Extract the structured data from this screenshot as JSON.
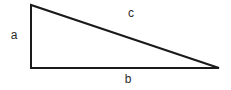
{
  "figure": {
    "name": "right-triangle-diagram",
    "background_color": "#ffffff",
    "stroke_color": "#1a1a1a",
    "stroke_width": 2,
    "text_color": "#2b2b2b",
    "vertices": {
      "apex": [
        31,
        5
      ],
      "bottom_left": [
        31,
        68
      ],
      "bottom_right": [
        219,
        68
      ]
    },
    "polygon_points": "31,5 31,68 219,68",
    "labels": {
      "a": "a",
      "b": "b",
      "c": "c"
    },
    "sides": [
      {
        "label": "a",
        "role": "vertical-leg",
        "from": [
          31,
          5
        ],
        "to": [
          31,
          68
        ]
      },
      {
        "label": "b",
        "role": "horizontal-leg",
        "from": [
          31,
          68
        ],
        "to": [
          219,
          68
        ]
      },
      {
        "label": "c",
        "role": "hypotenuse",
        "from": [
          31,
          5
        ],
        "to": [
          219,
          68
        ]
      }
    ]
  }
}
